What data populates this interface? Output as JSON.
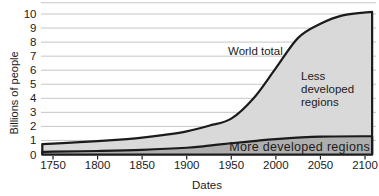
{
  "chart_data": {
    "type": "area",
    "title": "",
    "xlabel": "Dates",
    "ylabel": "Billions of people",
    "x_ticks": [
      1750,
      1800,
      1850,
      1900,
      1950,
      2000,
      2050,
      2100
    ],
    "y_ticks": [
      0,
      1,
      2,
      3,
      4,
      5,
      6,
      7,
      8,
      9,
      10
    ],
    "xlim": [
      1738,
      2108
    ],
    "ylim": [
      0,
      10.8
    ],
    "grid": "horizontal",
    "legend": "none",
    "series": [
      {
        "name": "World total",
        "role": "top-curve",
        "points": [
          [
            1738,
            0.74
          ],
          [
            1750,
            0.78
          ],
          [
            1775,
            0.86
          ],
          [
            1800,
            0.95
          ],
          [
            1825,
            1.06
          ],
          [
            1850,
            1.2
          ],
          [
            1875,
            1.4
          ],
          [
            1900,
            1.65
          ],
          [
            1925,
            2.05
          ],
          [
            1950,
            2.55
          ],
          [
            1975,
            4.0
          ],
          [
            2000,
            6.15
          ],
          [
            2025,
            8.3
          ],
          [
            2050,
            9.3
          ],
          [
            2075,
            9.9
          ],
          [
            2108,
            10.15
          ]
        ]
      },
      {
        "name": "More developed regions",
        "role": "bottom-band-top-curve",
        "points": [
          [
            1738,
            0.18
          ],
          [
            1750,
            0.2
          ],
          [
            1800,
            0.25
          ],
          [
            1850,
            0.33
          ],
          [
            1900,
            0.48
          ],
          [
            1925,
            0.63
          ],
          [
            1950,
            0.8
          ],
          [
            1975,
            0.95
          ],
          [
            2000,
            1.1
          ],
          [
            2050,
            1.27
          ],
          [
            2108,
            1.3
          ]
        ]
      }
    ],
    "regions": [
      {
        "name": "Less developed regions",
        "between": [
          "More developed regions",
          "World total"
        ],
        "fill": "#d9d9d9"
      },
      {
        "name": "More developed regions",
        "between": [
          "baseline",
          "More developed regions"
        ],
        "fill": "#aeaeae"
      }
    ],
    "colors": {
      "line": "#1b1b1b",
      "grid": "#c6c6c6",
      "less_developed_fill": "#d9d9d9",
      "more_developed_fill": "#aeaeae"
    }
  }
}
